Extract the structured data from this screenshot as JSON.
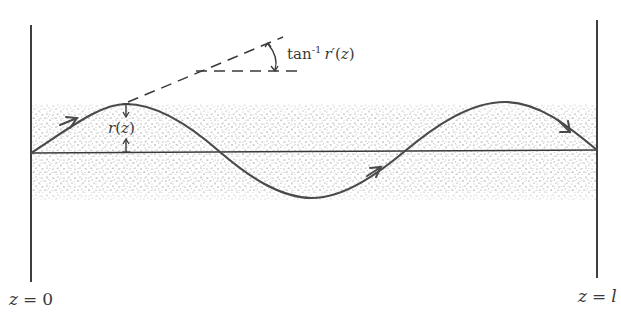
{
  "diagram": {
    "type": "ray-path-in-graded-index-medium",
    "labels": {
      "left_boundary": "z = 0",
      "right_boundary": "z = l",
      "left_boundary_var": "z",
      "left_boundary_eq": "=",
      "left_boundary_val": "0",
      "right_boundary_var": "z",
      "right_boundary_eq": "=",
      "right_boundary_val": "l",
      "radius": "r(z)",
      "radius_fn": "r",
      "radius_open": "(",
      "radius_arg": "z",
      "radius_close": ")",
      "angle": "tan⁻¹ r′(z)",
      "angle_fn": "tan",
      "angle_sup": "-1",
      "angle_r": "r",
      "angle_prime": "′",
      "angle_open": "(",
      "angle_arg": "z",
      "angle_close": ")"
    },
    "elements": {
      "left_plane": {
        "x": 31,
        "y_top": 25,
        "y_bottom": 282
      },
      "right_plane": {
        "x": 597,
        "y_top": 20,
        "y_bottom": 278
      },
      "optical_axis": {
        "x1": 31,
        "y1": 153,
        "x2": 597,
        "y2": 150
      },
      "medium_band": {
        "x1": 31,
        "x2": 597,
        "y_top": 103,
        "y_bottom": 200
      },
      "ray_path_points": [
        [
          31,
          153
        ],
        [
          126,
          104
        ],
        [
          220,
          152
        ],
        [
          312,
          198
        ],
        [
          405,
          151
        ],
        [
          505,
          102
        ],
        [
          597,
          150
        ]
      ],
      "direction_arrows": 3,
      "tangent_line": {
        "x1": 126,
        "y1": 104,
        "x2": 283,
        "y2": 37
      },
      "reference_line": {
        "x1": 196,
        "y1": 71,
        "x2": 298,
        "y2": 71
      }
    },
    "colors": {
      "ink": "#4a4a4a",
      "stipple": "#6b6b6b",
      "background": "#ffffff"
    }
  }
}
